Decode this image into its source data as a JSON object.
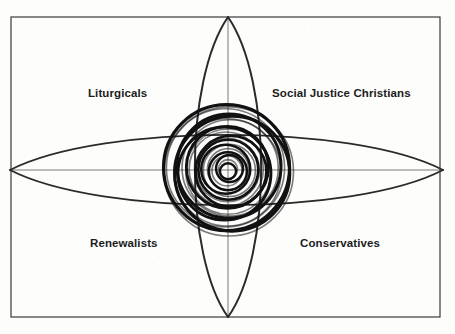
{
  "figure": {
    "type": "quadrant-venn-diagram",
    "background_color": "#fdfdfc",
    "ink_color": "#1a1a1a",
    "frame": {
      "x": 11,
      "y": 17,
      "width": 429,
      "height": 300,
      "stroke_color": "#3a3a3a",
      "stroke_width": 1.2
    },
    "center": {
      "x": 228,
      "y": 170
    },
    "axes": {
      "stroke_color": "#6b6b6b",
      "stroke_width": 0.9,
      "vertical": {
        "x": 228,
        "y1": 17,
        "y2": 317
      },
      "horizontal": {
        "y": 170,
        "x1": 11,
        "x2": 440
      }
    },
    "vertical_lens": {
      "name": "vertical-vesica",
      "apex_top_y": 17,
      "apex_bottom_y": 317,
      "half_width": 33,
      "stroke_color": "#2a2a2a",
      "stroke_width": 2.0
    },
    "horizontal_lens": {
      "name": "horizontal-vesica",
      "apex_left_x": 10,
      "apex_right_x": 443,
      "half_height": 35,
      "stroke_color": "#2a2a2a",
      "stroke_width": 1.8
    },
    "concentric_spiral": {
      "name": "central-concentric-circles",
      "ring_count": 11,
      "inner_radius": 8,
      "outer_radius": 63,
      "offset_jitter": 3.5,
      "stroke_color": "#111111",
      "stroke_width": 3.0
    }
  },
  "labels": {
    "top_left": "Liturgicals",
    "top_right": "Social Justice Christians",
    "bottom_left": "Renewalists",
    "bottom_right": "Conservatives"
  }
}
